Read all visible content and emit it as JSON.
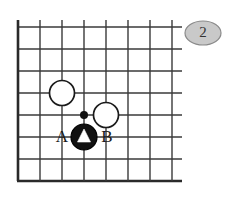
{
  "diagram": {
    "type": "go-board-problem",
    "figure_number": "2",
    "board": {
      "grid_columns": 8,
      "grid_rows": 8,
      "cell_size": 22,
      "origin_x": 18,
      "origin_y": 27,
      "left_edge_is_board_border": true,
      "bottom_edge_is_board_border": true
    },
    "stones": [
      {
        "id": "white-1",
        "color": "white",
        "col": 2,
        "row": 3,
        "marker": "none"
      },
      {
        "id": "white-2",
        "color": "white",
        "col": 4,
        "row": 4,
        "marker": "none"
      },
      {
        "id": "black-1",
        "color": "black",
        "col": 3,
        "row": 5,
        "marker": "triangle"
      }
    ],
    "star_points": [
      {
        "id": "star-1",
        "col": 3,
        "row": 4
      }
    ],
    "point_labels": [
      {
        "id": "label-a",
        "text": "A",
        "col": 2,
        "row": 5
      },
      {
        "id": "label-b",
        "text": "B",
        "col": 4,
        "row": 5
      }
    ],
    "colors": {
      "grid": "#3a3a3a",
      "grid_edge": "#2a2a2a",
      "black_stone": "#111111",
      "white_stone": "#ffffff",
      "badge_fill": "#c9c9c9",
      "badge_stroke": "#8a8a8a",
      "background": "#ffffff"
    }
  }
}
